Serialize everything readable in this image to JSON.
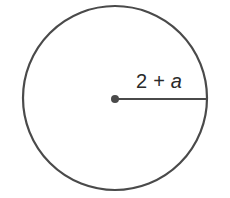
{
  "diagram": {
    "type": "circle-with-radius",
    "radius_label": {
      "constant": "2",
      "operator": "+",
      "variable": "a"
    },
    "stroke_color": "#4a4a4a",
    "background": "#ffffff"
  }
}
